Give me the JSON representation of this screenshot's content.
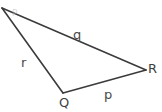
{
  "diagram": {
    "background_color": "#ffffff",
    "stroke_color": "#3b3b3b",
    "stroke_width": 1.6,
    "width": 162,
    "height": 112,
    "shape_type": "triangle",
    "vertices": [
      {
        "name": "P",
        "label": "P",
        "x": 2,
        "y": 8,
        "label_x": 12,
        "label_y": 9,
        "clipped": true
      },
      {
        "name": "Q",
        "label": "Q",
        "x": 63,
        "y": 93,
        "label_x": 59,
        "label_y": 96,
        "clipped": false
      },
      {
        "name": "R",
        "label": "R",
        "x": 146,
        "y": 70,
        "label_x": 148,
        "label_y": 62,
        "clipped": false
      }
    ],
    "sides": [
      {
        "name": "q",
        "label": "q",
        "from": "P",
        "to": "R",
        "label_x": 73,
        "label_y": 28
      },
      {
        "name": "r",
        "label": "r",
        "from": "P",
        "to": "Q",
        "label_x": 21,
        "label_y": 56
      },
      {
        "name": "p",
        "label": "p",
        "from": "Q",
        "to": "R",
        "label_x": 104,
        "label_y": 88
      }
    ]
  }
}
